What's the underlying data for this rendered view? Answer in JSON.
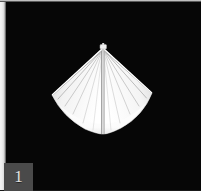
{
  "viewer": {
    "width": 201,
    "height": 191,
    "background_color": "#060606",
    "frame_color": "#ededed",
    "alt": "white canopy umbrella object on black background"
  },
  "subject": {
    "name": "canopy-object",
    "description": "white 3D-rendered canopy / parasol viewed at a low angle, diamond silhouette with radiating ribs and a central pole",
    "fill_color": "#ffffff",
    "rib_color": "#b4b4b4",
    "outline_color": "#d8d8d8",
    "shadow_color": "#8a8a8a",
    "apex": {
      "x": 52,
      "y": 4
    },
    "left_tip": {
      "x": 1,
      "y": 52
    },
    "right_tip": {
      "x": 101,
      "y": 50
    },
    "bottom": {
      "x": 53,
      "y": 90
    },
    "finial": {
      "x": 52,
      "y": 2,
      "width": 7,
      "height": 5
    },
    "pole": {
      "x": 52,
      "top": 8,
      "bottom": 91
    },
    "rib_count_left": 6,
    "rib_count_right": 6
  },
  "badge": {
    "label": "1",
    "background_color": "#4a4a4a",
    "text_color": "#e2e2e2"
  }
}
